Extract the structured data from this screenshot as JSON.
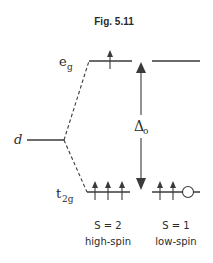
{
  "figure": {
    "title": "Fig. 5.11",
    "labels": {
      "d": "d",
      "eg_main": "e",
      "eg_sub": "g",
      "t2g_main": "t",
      "t2g_sub": "2g",
      "delta_main": "Δ",
      "delta_sub": "o"
    },
    "configurations": [
      {
        "name": "high-spin",
        "spin_label": "S = 2",
        "config_label": "high-spin",
        "t2g_electrons": [
          "up",
          "up",
          "up"
        ],
        "eg_electrons": [
          "up"
        ]
      },
      {
        "name": "low-spin",
        "spin_label": "S = 1",
        "config_label": "low-spin",
        "t2g_electrons": [
          "up",
          "up",
          "empty"
        ],
        "eg_electrons": []
      }
    ],
    "colors": {
      "ink": "#3a3a3a",
      "background": "#ffffff"
    }
  }
}
